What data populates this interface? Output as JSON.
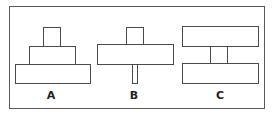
{
  "figure": {
    "line_color": "#4a4a4a",
    "background": "#ffffff",
    "panels": [
      {
        "label": "A",
        "description": "three stacked blocks, widening toward bottom (pyramid)"
      },
      {
        "label": "B",
        "description": "small block on wide slab supported by thin stem"
      },
      {
        "label": "C",
        "description": "two wide slabs connected by short central column"
      }
    ]
  }
}
